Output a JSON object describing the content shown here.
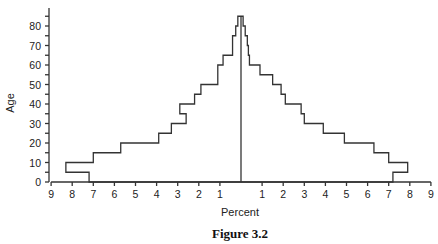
{
  "chart_data": {
    "type": "bar",
    "subtype": "population-pyramid",
    "title": "",
    "caption": "Figure 3.2",
    "xlabel": "Percent",
    "ylabel": "Age",
    "x_ticks_left": [
      "9",
      "8",
      "7",
      "6",
      "5",
      "4",
      "3",
      "2",
      "1"
    ],
    "x_ticks_right": [
      "1",
      "2",
      "3",
      "4",
      "5",
      "6",
      "7",
      "8",
      "9"
    ],
    "y_ticks": [
      "0",
      "10",
      "20",
      "30",
      "40",
      "50",
      "60",
      "70",
      "80"
    ],
    "xlim": [
      -9,
      9
    ],
    "ylim": [
      0,
      88
    ],
    "grid": false,
    "legend": null,
    "categories": [
      "0-5",
      "5-10",
      "10-15",
      "15-20",
      "20-25",
      "25-30",
      "30-35",
      "35-40",
      "40-45",
      "45-50",
      "50-55",
      "55-60",
      "60-65",
      "65-70",
      "70-75",
      "75-80",
      "80-85"
    ],
    "series": [
      {
        "name": "Left",
        "side": "left",
        "values": [
          7.2,
          8.3,
          7.0,
          5.7,
          3.9,
          3.3,
          2.6,
          2.9,
          2.2,
          1.9,
          1.1,
          1.1,
          0.85,
          0.4,
          0.4,
          0.25,
          0.15
        ]
      },
      {
        "name": "Right",
        "side": "right",
        "values": [
          7.2,
          7.9,
          7.0,
          6.3,
          4.9,
          3.9,
          3.0,
          2.85,
          2.1,
          1.9,
          1.5,
          0.9,
          0.4,
          0.35,
          0.3,
          0.2,
          0.1
        ]
      }
    ]
  }
}
